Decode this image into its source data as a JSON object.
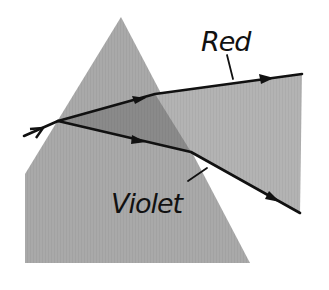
{
  "labels": {
    "red": "Red",
    "violet": "Violet"
  },
  "colors": {
    "background": "#ffffff",
    "prism_fill": "#a9a9a9",
    "prism_inside_fan": "#8a8a8a",
    "fan_outside": "#b3b3b3",
    "ray": "#111111"
  },
  "elements": {
    "prism": "triangular-glass-prism",
    "incident_ray": "white-light-beam",
    "rays": [
      "red",
      "violet"
    ]
  }
}
